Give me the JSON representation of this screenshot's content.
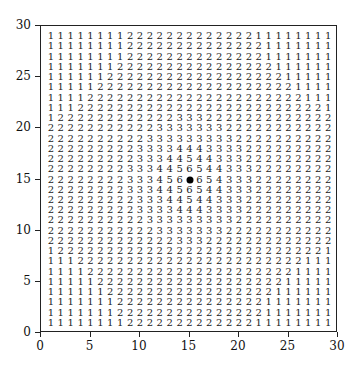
{
  "chart_data": {
    "type": "heatmap",
    "title": "",
    "xlabel": "",
    "ylabel": "",
    "xlim": [
      0,
      30
    ],
    "ylim": [
      0,
      30
    ],
    "x_ticks": [
      0,
      5,
      10,
      15,
      20,
      25,
      30
    ],
    "y_ticks": [
      0,
      5,
      10,
      15,
      20,
      25,
      30
    ],
    "grid": false,
    "marker": {
      "x": 15,
      "y": 15,
      "symbol": "filled-circle"
    },
    "cell_x": [
      1,
      2,
      3,
      4,
      5,
      6,
      7,
      8,
      9,
      10,
      11,
      12,
      13,
      14,
      15,
      16,
      17,
      18,
      19,
      20,
      21,
      22,
      23,
      24,
      25,
      26,
      27,
      28,
      29
    ],
    "rows": [
      {
        "y": 29,
        "values": "1 1 1 1 1 1 1 1 2 2 2 2 2 2 2 2 2 2 2 2 2 1 1 1 1 1 1 1 1"
      },
      {
        "y": 28,
        "values": "1 1 1 1 1 1 1 1 2 2 2 2 2 2 2 2 2 2 2 2 2 2 1 1 1 1 1 1 1"
      },
      {
        "y": 27,
        "values": "1 1 1 1 1 1 1 1 2 2 2 2 2 2 2 2 2 2 2 2 2 2 1 1 1 1 1 1 1"
      },
      {
        "y": 26,
        "values": "1 1 1 1 1 1 1 2 2 2 2 2 2 2 2 2 2 2 2 2 2 2 2 1 1 1 1 1 1"
      },
      {
        "y": 25,
        "values": "1 1 1 1 1 1 2 2 2 2 2 2 2 2 2 2 2 2 2 2 2 2 2 2 1 1 1 1 1"
      },
      {
        "y": 24,
        "values": "1 1 1 1 1 2 2 2 2 2 2 2 2 2 2 2 2 2 2 2 2 2 2 2 2 1 1 1 1"
      },
      {
        "y": 23,
        "values": "1 1 1 1 2 2 2 2 2 2 2 2 2 2 2 2 2 2 2 2 2 2 2 2 2 2 1 1 1"
      },
      {
        "y": 22,
        "values": "1 1 1 2 2 2 2 2 2 2 2 2 2 2 2 2 2 2 2 2 2 2 2 2 2 2 2 2 1"
      },
      {
        "y": 21,
        "values": "1 2 2 2 2 2 2 2 2 2 2 2 2 3 3 3 2 2 2 2 2 2 2 2 2 2 2 2 2"
      },
      {
        "y": 20,
        "values": "2 2 2 2 2 2 2 2 2 2 2 3 3 3 3 3 3 3 2 2 2 2 2 2 2 2 2 2 2"
      },
      {
        "y": 19,
        "values": "2 2 2 2 2 2 2 2 2 2 3 3 3 3 3 3 3 3 3 2 2 2 2 2 2 2 2 2 2"
      },
      {
        "y": 18,
        "values": "2 2 2 2 2 2 2 2 2 3 3 3 3 4 4 4 3 3 3 3 2 2 2 2 2 2 2 2 2"
      },
      {
        "y": 17,
        "values": "2 2 2 2 2 2 2 2 2 3 3 3 4 4 5 4 4 3 3 3 2 2 2 2 2 2 2 2 2"
      },
      {
        "y": 16,
        "values": "2 2 2 2 2 2 2 2 3 3 3 4 4 5 6 5 4 4 3 3 3 2 2 2 2 2 2 2 2"
      },
      {
        "y": 15,
        "values": "2 2 2 2 2 2 2 2 3 3 3 4 5 6 * 6 5 4 3 3 3 2 2 2 2 2 2 2 2"
      },
      {
        "y": 14,
        "values": "2 2 2 2 2 2 2 2 3 3 3 4 4 5 6 5 4 4 3 3 3 2 2 2 2 2 2 2 2"
      },
      {
        "y": 13,
        "values": "2 2 2 2 2 2 2 2 2 3 3 3 4 4 5 4 4 3 3 3 2 2 2 2 2 2 2 2 2"
      },
      {
        "y": 12,
        "values": "2 2 2 2 2 2 2 2 2 3 3 3 3 4 4 4 3 3 3 3 2 2 2 2 2 2 2 2 2"
      },
      {
        "y": 11,
        "values": "2 2 2 2 2 2 2 2 2 2 3 3 3 3 3 3 3 3 3 2 2 2 2 2 2 2 2 2 2"
      },
      {
        "y": 10,
        "values": "2 2 2 2 2 2 2 2 2 2 2 3 3 3 3 3 3 3 2 2 2 2 2 2 2 2 2 2 2"
      },
      {
        "y": 9,
        "values": "2 2 2 2 2 2 2 2 2 2 2 2 2 3 3 3 2 2 2 2 2 2 2 2 2 2 2 2 2"
      },
      {
        "y": 8,
        "values": "1 2 2 2 2 2 2 2 2 2 2 2 2 2 2 2 2 2 2 2 2 2 2 2 2 2 2 2 1"
      },
      {
        "y": 7,
        "values": "1 1 1 2 2 2 2 2 2 2 2 2 2 2 2 2 2 2 2 2 2 2 2 2 2 2 1 1 1"
      },
      {
        "y": 6,
        "values": "1 1 1 1 2 2 2 2 2 2 2 2 2 2 2 2 2 2 2 2 2 2 2 2 2 1 1 1 1"
      },
      {
        "y": 5,
        "values": "1 1 1 1 1 2 2 2 2 2 2 2 2 2 2 2 2 2 2 2 2 2 2 2 1 1 1 1 1"
      },
      {
        "y": 4,
        "values": "1 1 1 1 1 1 2 2 2 2 2 2 2 2 2 2 2 2 2 2 2 2 2 1 1 1 1 1 1"
      },
      {
        "y": 3,
        "values": "1 1 1 1 1 1 1 2 2 2 2 2 2 2 2 2 2 2 2 2 2 2 1 1 1 1 1 1 1"
      },
      {
        "y": 2,
        "values": "1 1 1 1 1 1 1 2 2 2 2 2 2 2 2 2 2 2 2 2 2 2 1 1 1 1 1 1 1"
      },
      {
        "y": 1,
        "values": "1 1 1 1 1 1 1 1 2 2 2 2 2 2 2 2 2 2 2 2 2 1 1 1 1 1 1 1 1"
      }
    ]
  },
  "colors": {
    "text": "#222222",
    "axis": "#222222",
    "background": "#ffffff",
    "marker": "#000000"
  }
}
